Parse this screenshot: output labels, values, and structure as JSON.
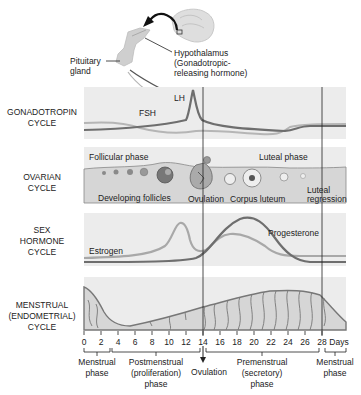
{
  "header": {
    "pituitary_label_line1": "Pituitary",
    "pituitary_label_line2": "gland",
    "hypothalamus_line1": "Hypothalamus",
    "hypothalamus_line2": "(Gonadotropic-",
    "hypothalamus_line3": "releasing hormone)"
  },
  "rows": [
    {
      "label_line1": "GONADOTROPIN",
      "label_line2": "CYCLE",
      "label_line3": ""
    },
    {
      "label_line1": "OVARIAN",
      "label_line2": "CYCLE",
      "label_line3": ""
    },
    {
      "label_line1": "SEX",
      "label_line2": "HORMONE",
      "label_line3": "CYCLE"
    },
    {
      "label_line1": "MENSTRUAL",
      "label_line2": "(ENDOMETRIAL)",
      "label_line3": "CYCLE"
    }
  ],
  "gonadotropin": {
    "lh_label": "LH",
    "fsh_label": "FSH"
  },
  "ovarian": {
    "follicular_phase": "Follicular phase",
    "luteal_phase": "Luteal phase",
    "developing_follicles": "Developing follicles",
    "ovulation": "Ovulation",
    "corpus_luteum": "Corpus luteum",
    "luteal_regression_line1": "Luteal",
    "luteal_regression_line2": "regression"
  },
  "sex_hormone": {
    "estrogen_label": "Estrogen",
    "progesterone_label": "Progesterone"
  },
  "axis": {
    "ticks": [
      "0",
      "2",
      "4",
      "6",
      "8",
      "10",
      "12",
      "14",
      "16",
      "18",
      "20",
      "22",
      "24",
      "26",
      "28"
    ],
    "unit": "Days"
  },
  "phases": {
    "menstrual_1_line1": "Menstrual",
    "menstrual_1_line2": "phase",
    "postmenstrual_line1": "Postmenstrual",
    "postmenstrual_line2": "(proliferation)",
    "postmenstrual_line3": "phase",
    "ovulation": "Ovulation",
    "premenstrual_line1": "Premenstrual",
    "premenstrual_line2": "(secretory)",
    "premenstrual_line3": "phase",
    "menstrual_2_line1": "Menstrual",
    "menstrual_2_line2": "phase"
  },
  "colors": {
    "panel_bg": "#ececec",
    "lh_curve": "#6e6e6e",
    "fsh_curve": "#b5b5b5",
    "estrogen_curve": "#a8a8a8",
    "progesterone_curve": "#6e6e6e",
    "endometrium_fill": "#d6d6d6",
    "divider": "#222222"
  }
}
